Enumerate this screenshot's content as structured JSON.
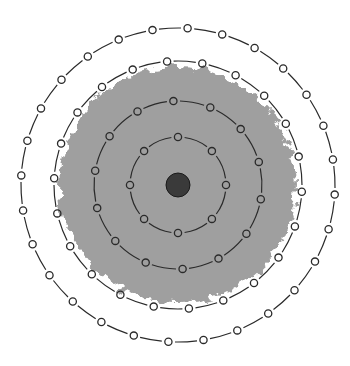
{
  "diagram": {
    "title": "",
    "center": [
      178,
      185
    ],
    "background_color": "#ffffff",
    "cloud": {
      "radius": 118,
      "color": "#9a9a9a"
    },
    "nucleus": {
      "radius": 12,
      "color": "#3a3a3a"
    },
    "rings": [
      {
        "name": "ring-1",
        "radius": 48,
        "nodes": 8
      },
      {
        "name": "ring-2",
        "radius": 84,
        "nodes": 14
      },
      {
        "name": "ring-3",
        "radius": 124,
        "nodes": 22
      },
      {
        "name": "ring-4",
        "radius": 157,
        "nodes": 28
      }
    ],
    "stroke_color": "#2a2a2a"
  }
}
